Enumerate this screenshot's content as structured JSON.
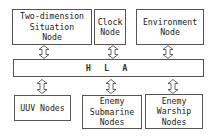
{
  "diagram": {
    "top_nodes": [
      {
        "id": "two-dimension-situation-node",
        "lines": [
          "Two-dimension",
          "Situation",
          "Node"
        ]
      },
      {
        "id": "clock-node",
        "lines": [
          "Clock",
          "Node"
        ]
      },
      {
        "id": "environment-node",
        "lines": [
          "Environment",
          "Node"
        ]
      }
    ],
    "bus": {
      "label": "H L A"
    },
    "bottom_nodes": [
      {
        "id": "uuv-nodes",
        "lines": [
          "UUV Nodes"
        ]
      },
      {
        "id": "enemy-submarine-nodes",
        "lines": [
          "Enemy",
          "Submarine",
          "Nodes"
        ]
      },
      {
        "id": "enemy-warship-nodes",
        "lines": [
          "Enemy",
          "Warship",
          "Nodes"
        ]
      }
    ],
    "connectors": "bidirectional-arrow",
    "colors": {
      "border": "#555555",
      "background": "#ffffff",
      "text": "#222222"
    }
  }
}
